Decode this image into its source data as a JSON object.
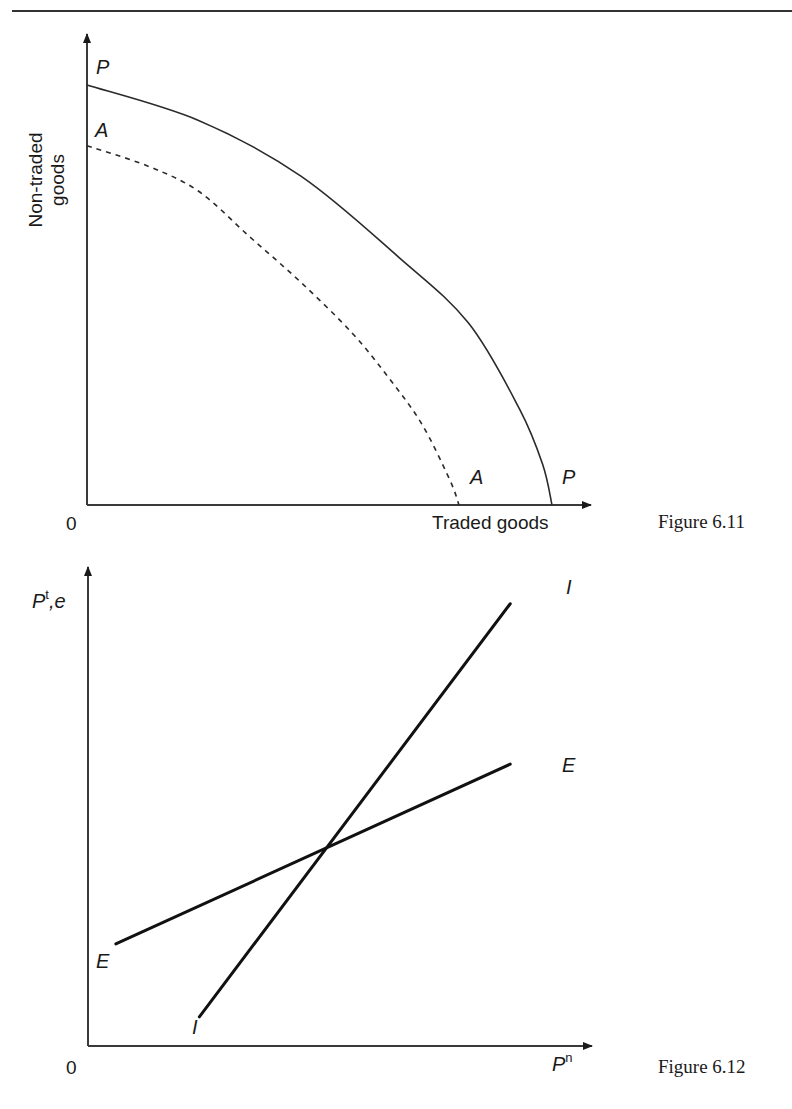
{
  "page": {
    "header_rule": true
  },
  "figures": [
    {
      "caption": "Figure 6.11",
      "origin_label": "0",
      "y_axis_label_line1": "Non-traded",
      "y_axis_label_line2": "goods",
      "x_axis_label": "Traded goods",
      "curves": [
        {
          "name": "P",
          "style": "solid",
          "label_top": "P",
          "label_bottom": "P"
        },
        {
          "name": "A",
          "style": "dashed",
          "label_top": "A",
          "label_bottom": "A"
        }
      ]
    },
    {
      "caption": "Figure 6.12",
      "origin_label": "0",
      "y_axis_label_main": "P",
      "y_axis_label_sup": "t",
      "y_axis_label_rest": ",e",
      "x_axis_label_main": "P",
      "x_axis_label_sup": "n",
      "lines": [
        {
          "name": "I",
          "label_top": "I",
          "label_bottom": "I"
        },
        {
          "name": "E",
          "label_top": "E",
          "label_bottom": "E"
        }
      ]
    }
  ],
  "chart_data": [
    {
      "type": "line",
      "title": "Figure 6.11",
      "xlabel": "Traded goods",
      "ylabel": "Non-traded goods",
      "xlim": [
        0,
        1
      ],
      "ylim": [
        0,
        1
      ],
      "grid": false,
      "series": [
        {
          "name": "P",
          "style": "solid",
          "x": [
            0,
            0.24,
            0.46,
            0.67,
            0.82,
            0.93,
            0.98,
            1.0
          ],
          "y": [
            0.83,
            0.76,
            0.65,
            0.49,
            0.36,
            0.19,
            0.08,
            0.0
          ]
        },
        {
          "name": "A",
          "style": "dashed",
          "x": [
            0,
            0.13,
            0.24,
            0.35,
            0.46,
            0.57,
            0.65,
            0.72,
            0.78,
            0.8
          ],
          "y": [
            0.71,
            0.67,
            0.62,
            0.53,
            0.44,
            0.34,
            0.25,
            0.16,
            0.05,
            0.0
          ]
        }
      ]
    },
    {
      "type": "line",
      "title": "Figure 6.12",
      "xlabel": "P^n",
      "ylabel": "P^t, e",
      "xlim": [
        0,
        1
      ],
      "ylim": [
        0,
        1
      ],
      "grid": false,
      "series": [
        {
          "name": "I",
          "x": [
            0.24,
            0.91
          ],
          "y": [
            0.06,
            0.91
          ]
        },
        {
          "name": "E",
          "x": [
            0.06,
            0.91
          ],
          "y": [
            0.21,
            0.58
          ]
        }
      ],
      "intersection": {
        "x": 0.52,
        "y": 0.4
      }
    }
  ]
}
